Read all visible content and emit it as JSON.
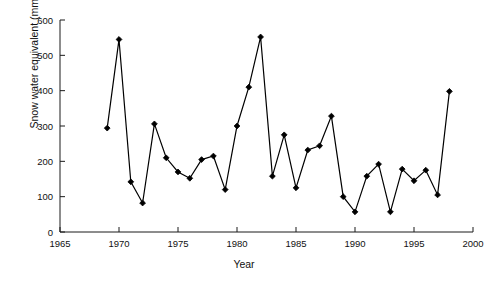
{
  "chart_data": {
    "type": "line",
    "title": "",
    "xlabel": "Year",
    "ylabel": "Snow water equivalent (mm)",
    "xlim": [
      1965,
      2000
    ],
    "ylim": [
      0,
      600
    ],
    "xticks": [
      1965,
      1970,
      1975,
      1980,
      1985,
      1990,
      1995,
      2000
    ],
    "yticks": [
      0,
      100,
      200,
      300,
      400,
      500,
      600
    ],
    "grid": false,
    "legend": null,
    "marker": "diamond",
    "marker_color": "#000000",
    "line_color": "#000000",
    "x": [
      1969,
      1970,
      1971,
      1972,
      1973,
      1974,
      1975,
      1976,
      1977,
      1978,
      1979,
      1980,
      1981,
      1982,
      1983,
      1984,
      1985,
      1986,
      1987,
      1988,
      1989,
      1990,
      1991,
      1992,
      1993,
      1994,
      1995,
      1996,
      1997,
      1998
    ],
    "values": [
      294,
      545,
      142,
      82,
      306,
      210,
      170,
      152,
      205,
      215,
      120,
      300,
      410,
      552,
      158,
      275,
      125,
      232,
      244,
      328,
      100,
      57,
      158,
      192,
      57,
      178,
      145,
      175,
      105,
      398
    ],
    "series": [
      {
        "name": "Snow water equivalent",
        "values": [
          294,
          545,
          142,
          82,
          306,
          210,
          170,
          152,
          205,
          215,
          120,
          300,
          410,
          552,
          158,
          275,
          125,
          232,
          244,
          328,
          100,
          57,
          158,
          192,
          57,
          178,
          145,
          175,
          105,
          398
        ]
      }
    ]
  },
  "axis": {
    "y_tick_labels": [
      "0",
      "100",
      "200",
      "300",
      "400",
      "500",
      "600"
    ],
    "x_tick_labels": [
      "1965",
      "1970",
      "1975",
      "1980",
      "1985",
      "1990",
      "1995",
      "2000"
    ],
    "x_title": "Year",
    "y_title": "Snow water equivalent (mm)"
  }
}
